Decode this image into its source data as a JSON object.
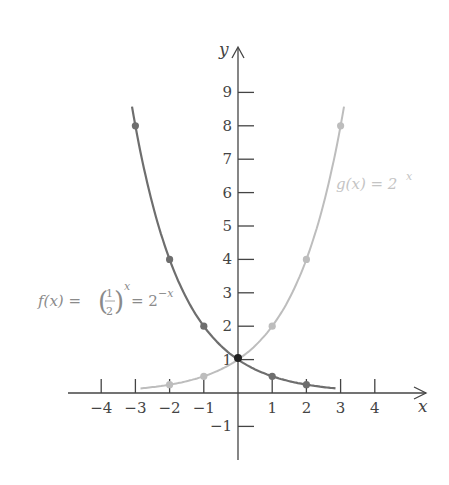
{
  "chart_data": {
    "type": "line",
    "title": "",
    "xlabel": "x",
    "ylabel": "y",
    "xlim": [
      -4.5,
      5.3
    ],
    "ylim": [
      -1.6,
      10.5
    ],
    "grid": false,
    "x_ticks": [
      -4,
      -3,
      -2,
      -1,
      1,
      2,
      3,
      4
    ],
    "x_tick_labels": [
      "−4",
      "−3",
      "−2",
      "−1",
      "1",
      "2",
      "3",
      "4"
    ],
    "y_ticks": [
      -1,
      1,
      2,
      3,
      4,
      5,
      6,
      7,
      8,
      9
    ],
    "y_tick_labels": [
      "−1",
      "1",
      "2",
      "3",
      "4",
      "5",
      "6",
      "7",
      "8",
      "9"
    ],
    "series": [
      {
        "name": "f(x) = (1/2)^x = 2^(−x)",
        "color": "#6e6e6e",
        "x": [
          -3,
          -2,
          -1,
          0,
          1,
          2
        ],
        "values": [
          8,
          4,
          2,
          1,
          0.5,
          0.25
        ]
      },
      {
        "name": "g(x) = 2^x",
        "color": "#bdbdbd",
        "x": [
          -2,
          -1,
          0,
          1,
          2,
          3
        ],
        "values": [
          0.25,
          0.5,
          1,
          2,
          4,
          8
        ]
      }
    ],
    "annotations": [
      {
        "text": "f(x) = (1/2)^x = 2^(−x)",
        "position": "left-middle"
      },
      {
        "text": "g(x) = 2^x",
        "position": "right-upper"
      }
    ]
  },
  "labels": {
    "x_axis": "x",
    "y_axis": "y",
    "f_label": {
      "lhs": "f(x) =",
      "num": "1",
      "den": "2",
      "exp1": "x",
      "mid": "= 2",
      "exp2": "−x"
    },
    "g_label": {
      "lhs": "g(x) = 2",
      "exp": "x"
    }
  }
}
